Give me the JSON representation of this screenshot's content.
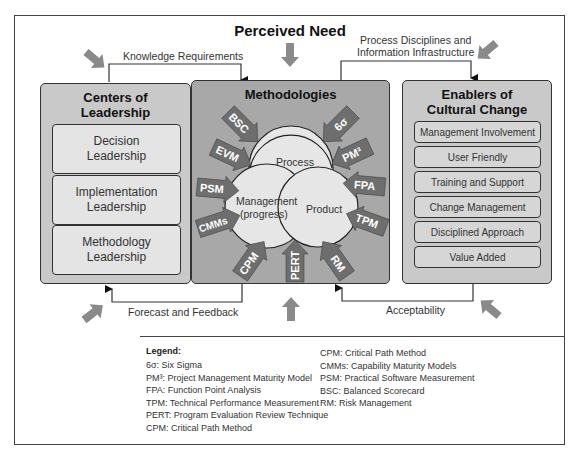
{
  "title": "Perceived Need",
  "flows": {
    "top_left": "Knowledge Requirements",
    "top_right_line1": "Process Disciplines and",
    "top_right_line2": "Information Infrastructure",
    "bottom_left": "Forecast and Feedback",
    "bottom_right": "Acceptability"
  },
  "left_panel": {
    "title_line1": "Centers of",
    "title_line2": "Leadership",
    "items": [
      {
        "line1": "Decision",
        "line2": "Leadership"
      },
      {
        "line1": "Implementation",
        "line2": "Leadership"
      },
      {
        "line1": "Methodology",
        "line2": "Leadership"
      }
    ]
  },
  "center_panel": {
    "title": "Methodologies",
    "venn": {
      "process": "Process",
      "management_line1": "Management",
      "management_line2": "(progress)",
      "product": "Product"
    },
    "arrows": [
      "BSC",
      "6σ",
      "EVM",
      "PM³",
      "PSM",
      "FPA",
      "CMMs",
      "TPM",
      "CPM",
      "PERT",
      "RM"
    ]
  },
  "right_panel": {
    "title_line1": "Enablers of",
    "title_line2": "Cultural Change",
    "items": [
      "Management Involvement",
      "User Friendly",
      "Training and Support",
      "Change Management",
      "Disciplined Approach",
      "Value Added"
    ]
  },
  "legend": {
    "title": "Legend:",
    "col1": [
      "6σ: Six Sigma",
      "PM³: Project Management Maturity Model",
      "FPA: Function Point Analysis",
      "TPM: Technical Performance Measurement",
      "PERT: Program Evaluation Review Technique",
      "CPM: Critical Path Method"
    ],
    "col2": [
      "CPM: Critical Path Method",
      "CMMs: Capability Maturity Models",
      "PSM: Practical Software Measurement",
      "BSC: Balanced Scorecard",
      "RM: Risk Management"
    ]
  },
  "colors": {
    "side_panel": "#c9c9c9",
    "center_panel": "#a8a8a8",
    "arrow_fill": "#6e6e6e",
    "venn_fill": "#e6e6e6",
    "gray_arrow": "#8a8a8a"
  }
}
